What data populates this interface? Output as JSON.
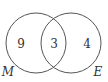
{
  "diagram": {
    "type": "venn",
    "sets": [
      {
        "name": "M",
        "label": "M"
      },
      {
        "name": "E",
        "label": "E"
      }
    ],
    "regions": {
      "only_M": "9",
      "M_and_E": "3",
      "only_E": "4"
    },
    "colors": {
      "stroke": "#555555",
      "text": "#333333",
      "background": "#ffffff"
    }
  }
}
